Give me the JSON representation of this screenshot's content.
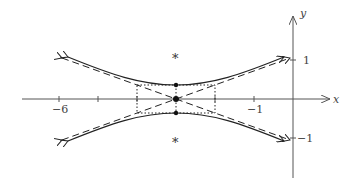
{
  "diagram": {
    "type": "hyperbola-plot",
    "equation_description": "vertical hyperbola centered at (-3, 0) with asymptotes, central rectangle, vertices and foci",
    "axes": {
      "x_label": "x",
      "y_label": "y",
      "x_ticks": [
        {
          "value": -6,
          "label": "−6"
        },
        {
          "value": -5,
          "label": ""
        },
        {
          "value": -4,
          "label": ""
        },
        {
          "value": -3,
          "label": ""
        },
        {
          "value": -2,
          "label": ""
        },
        {
          "value": -1,
          "label": "−1"
        }
      ],
      "y_ticks": [
        {
          "value": 1,
          "label": "1"
        },
        {
          "value": -1,
          "label": "−1"
        }
      ]
    },
    "center": {
      "x": -3,
      "y": 0
    },
    "a": 0.36,
    "b": 1,
    "foci_marker": "*",
    "colors": {
      "curve": "#222222",
      "axis": "#555555",
      "label": "#444444"
    }
  }
}
